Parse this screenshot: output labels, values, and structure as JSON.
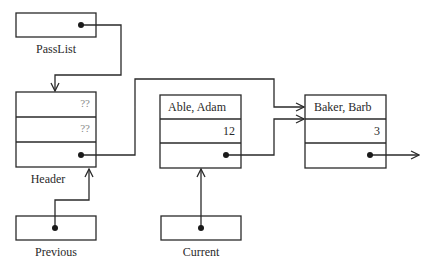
{
  "diagram": {
    "type": "linked-list-pointer-diagram",
    "variables": [
      {
        "name": "PassList"
      },
      {
        "name": "Header"
      },
      {
        "name": "Previous"
      },
      {
        "name": "Current"
      }
    ],
    "header_node": {
      "label": "Header",
      "field1": "??",
      "field2": "??"
    },
    "nodes": [
      {
        "name": "Able, Adam",
        "value": "12"
      },
      {
        "name": "Baker, Barb",
        "value": "3"
      }
    ],
    "labels": {
      "passlist": "PassList",
      "header": "Header",
      "previous": "Previous",
      "current": "Current"
    },
    "colors": {
      "line": "#2a2a2a",
      "background": "#ffffff"
    }
  }
}
